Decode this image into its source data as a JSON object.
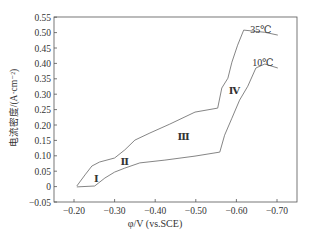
{
  "chart_data": {
    "type": "line",
    "title": "",
    "xlabel": "φ/V (vs.SCE)",
    "ylabel": "电流密度/(A·cm⁻²)",
    "xlim": [
      -0.15,
      -0.75
    ],
    "ylim": [
      -0.05,
      0.55
    ],
    "x_ticks": [
      "-0.20",
      "-0.30",
      "-0.40",
      "-0.50",
      "-0.60",
      "-0.70"
    ],
    "y_ticks": [
      "-0.05",
      "0",
      "0.05",
      "0.10",
      "0.15",
      "0.20",
      "0.25",
      "0.30",
      "0.35",
      "0.40",
      "0.45",
      "0.50",
      "0.55"
    ],
    "grid": false,
    "legend": "inline labels",
    "series": [
      {
        "name": "35℃",
        "x": [
          -0.207,
          -0.227,
          -0.244,
          -0.263,
          -0.3,
          -0.325,
          -0.35,
          -0.387,
          -0.436,
          -0.498,
          -0.554,
          -0.564,
          -0.579,
          -0.589,
          -0.603,
          -0.618,
          -0.67,
          -0.702
        ],
        "y": [
          0.002,
          0.038,
          0.067,
          0.08,
          0.093,
          0.119,
          0.151,
          0.174,
          0.203,
          0.242,
          0.255,
          0.32,
          0.352,
          0.404,
          0.459,
          0.508,
          0.501,
          0.492
        ]
      },
      {
        "name": "10℃",
        "x": [
          -0.207,
          -0.251,
          -0.276,
          -0.3,
          -0.325,
          -0.362,
          -0.424,
          -0.498,
          -0.559,
          -0.571,
          -0.589,
          -0.608,
          -0.628,
          -0.648,
          -0.67,
          -0.702
        ],
        "y": [
          -0.001,
          0.002,
          0.028,
          0.047,
          0.06,
          0.077,
          0.086,
          0.099,
          0.112,
          0.167,
          0.222,
          0.281,
          0.326,
          0.385,
          0.398,
          0.385
        ]
      }
    ],
    "annotations": [
      {
        "text": "Ⅰ",
        "x": -0.255,
        "y": 0.015
      },
      {
        "text": "Ⅱ",
        "x": -0.325,
        "y": 0.07
      },
      {
        "text": "Ⅲ",
        "x": -0.47,
        "y": 0.15
      },
      {
        "text": "Ⅳ",
        "x": -0.595,
        "y": 0.3
      },
      {
        "text": "35℃",
        "x": -0.66,
        "y": 0.5
      },
      {
        "text": "10℃",
        "x": -0.665,
        "y": 0.39
      }
    ]
  }
}
